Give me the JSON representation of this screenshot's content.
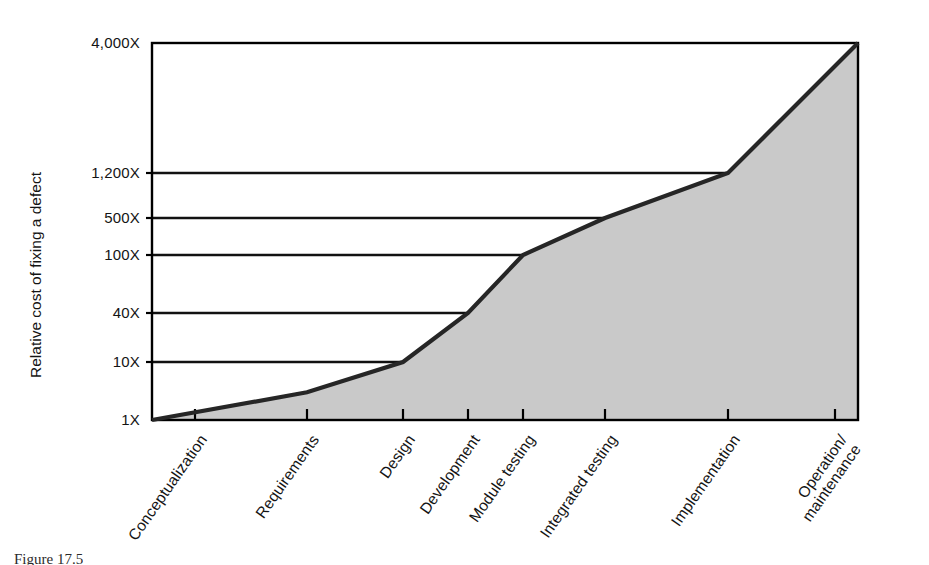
{
  "figure": {
    "caption": "Figure 17.5",
    "title": ""
  },
  "chart_data": {
    "type": "area",
    "title": "",
    "subtitle": "",
    "xlabel": "",
    "ylabel": "Relative cost of fixing a defect",
    "grid": true,
    "legend": null,
    "legend_position": "none",
    "categories": [
      "Conceptualization",
      "Requirements",
      "Design",
      "Development",
      "Module testing",
      "Integrated testing",
      "Implementation",
      "Operation/\nmaintenance"
    ],
    "category_labels": [
      "Conceptualization",
      "Requirements",
      "Design",
      "Development",
      "Module testing",
      "Integrated testing",
      "Implementation",
      "Operation/",
      "maintenance"
    ],
    "values": [
      1,
      3,
      10,
      40,
      100,
      500,
      1200,
      4000
    ],
    "value_labels": [
      "1X",
      "3X",
      "10X",
      "40X",
      "100X",
      "500X",
      "1,200X",
      "4,000X"
    ],
    "ytick_labels": [
      "1X",
      "10X",
      "40X",
      "100X",
      "500X",
      "1,200X",
      "4,000X"
    ],
    "ytick_values": [
      1,
      10,
      40,
      100,
      500,
      1200,
      4000
    ],
    "ylim": [
      1,
      4000
    ],
    "yscale": "custom-compressed",
    "series": [
      {
        "name": "Relative cost of fixing a defect",
        "values": [
          1,
          3,
          10,
          40,
          100,
          500,
          1200,
          4000
        ]
      }
    ],
    "colors": {
      "line": "#1a1a1a",
      "fill": "#c9c9c9",
      "grid": "#111111",
      "frame": "#000000",
      "text": "#141414",
      "background": "#ffffff"
    }
  },
  "geometry": {
    "plot_left": 152,
    "plot_right": 858,
    "plot_top": 43,
    "plot_bottom": 420,
    "ytick_pixels": [
      420,
      362,
      313,
      255,
      218,
      173,
      43
    ],
    "xtick_pixels": [
      195,
      307,
      403,
      468,
      523,
      605,
      728,
      835
    ],
    "xlabel_rotation": -55
  }
}
